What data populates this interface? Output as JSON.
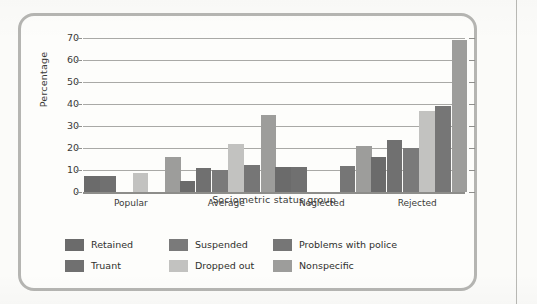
{
  "chart_data": {
    "type": "bar",
    "title": "",
    "xlabel": "Sociometric status group",
    "ylabel": "Percentage",
    "ylim": [
      0,
      70
    ],
    "ytick_step": 10,
    "yticks": [
      "0",
      "10",
      "20",
      "30",
      "40",
      "50",
      "60",
      "70"
    ],
    "grid": true,
    "legend_position": "bottom-left",
    "categories": [
      "Popular",
      "Average",
      "Neglected",
      "Rejected"
    ],
    "series": [
      {
        "name": "Retained",
        "color": "#6b6b6b",
        "values": [
          7.5,
          5.0,
          11.5,
          16.0
        ]
      },
      {
        "name": "Truant",
        "color": "#707070",
        "values": [
          7.5,
          11.0,
          11.5,
          23.5
        ]
      },
      {
        "name": "Suspended",
        "color": "#7a7a7a",
        "values": [
          null,
          10.0,
          null,
          20.0
        ]
      },
      {
        "name": "Dropped out",
        "color": "#c2c2c0",
        "values": [
          8.5,
          22.0,
          null,
          37.0
        ]
      },
      {
        "name": "Problems with police",
        "color": "#767676",
        "values": [
          null,
          12.5,
          12.0,
          39.0
        ]
      },
      {
        "name": "Nonspecific",
        "color": "#9d9d9b",
        "values": [
          16.0,
          35.0,
          21.0,
          69.0
        ]
      }
    ]
  },
  "legend": {
    "items": [
      {
        "label": "Retained",
        "color": "#6b6b6b"
      },
      {
        "label": "Suspended",
        "color": "#7a7a7a"
      },
      {
        "label": "Problems with police",
        "color": "#767676"
      },
      {
        "label": "Truant",
        "color": "#707070"
      },
      {
        "label": "Dropped out",
        "color": "#c2c2c0"
      },
      {
        "label": "Nonspecific",
        "color": "#9d9d9b"
      }
    ]
  }
}
